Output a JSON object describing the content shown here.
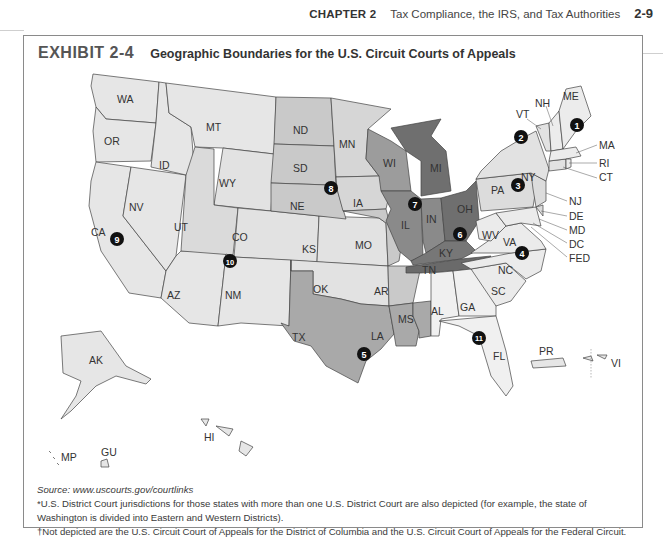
{
  "running_head": {
    "chapter": "CHAPTER 2",
    "title": "Tax Compliance, the IRS, and Tax Authorities",
    "page": "2-9"
  },
  "exhibit": {
    "number": "EXHIBIT 2-4",
    "title": "Geographic Boundaries for the U.S. Circuit Courts of Appeals"
  },
  "map": {
    "shade_colors": {
      "light": "#e6e6e6",
      "lighter": "#ececec",
      "medium": "#c9c9c9",
      "mediumdark": "#a9a9a9",
      "dark": "#7b7b7b",
      "darker": "#666666"
    },
    "states": [
      {
        "abbr": "WA",
        "circuit": 9,
        "districts": [
          "Western",
          "Eastern"
        ]
      },
      {
        "abbr": "OR",
        "circuit": 9
      },
      {
        "abbr": "CA",
        "circuit": 9,
        "districts": [
          "Northern",
          "Eastern",
          "Central",
          "Southern"
        ]
      },
      {
        "abbr": "NV",
        "circuit": 9
      },
      {
        "abbr": "ID",
        "circuit": 9
      },
      {
        "abbr": "MT",
        "circuit": 9
      },
      {
        "abbr": "AZ",
        "circuit": 9
      },
      {
        "abbr": "AK",
        "circuit": 9
      },
      {
        "abbr": "HI",
        "circuit": 9
      },
      {
        "abbr": "GU",
        "circuit": 9
      },
      {
        "abbr": "MP",
        "circuit": 9
      },
      {
        "abbr": "WY",
        "circuit": 10
      },
      {
        "abbr": "UT",
        "circuit": 10
      },
      {
        "abbr": "CO",
        "circuit": 10
      },
      {
        "abbr": "NM",
        "circuit": 10
      },
      {
        "abbr": "KS",
        "circuit": 10
      },
      {
        "abbr": "OK",
        "circuit": 10,
        "districts": [
          "Western",
          "Northern",
          "Eastern"
        ]
      },
      {
        "abbr": "ND",
        "circuit": 8
      },
      {
        "abbr": "SD",
        "circuit": 8
      },
      {
        "abbr": "NE",
        "circuit": 8
      },
      {
        "abbr": "MN",
        "circuit": 8
      },
      {
        "abbr": "IA",
        "circuit": 8,
        "districts": [
          "Northern",
          "Southern"
        ]
      },
      {
        "abbr": "MO",
        "circuit": 8,
        "districts": [
          "Western",
          "Eastern"
        ]
      },
      {
        "abbr": "AR",
        "circuit": 8,
        "districts": [
          "Western",
          "Eastern"
        ]
      },
      {
        "abbr": "TX",
        "circuit": 5,
        "districts": [
          "Northern",
          "Eastern",
          "Western",
          "Southern"
        ]
      },
      {
        "abbr": "LA",
        "circuit": 5,
        "districts": [
          "Western",
          "Middle",
          "Eastern"
        ]
      },
      {
        "abbr": "MS",
        "circuit": 5,
        "districts": [
          "Northern",
          "Southern"
        ]
      },
      {
        "abbr": "WI",
        "circuit": 7,
        "districts": [
          "Western",
          "Eastern"
        ]
      },
      {
        "abbr": "IL",
        "circuit": 7,
        "districts": [
          "Northern",
          "Central",
          "Southern"
        ]
      },
      {
        "abbr": "IN",
        "circuit": 7,
        "districts": [
          "Northern",
          "Southern"
        ]
      },
      {
        "abbr": "MI",
        "circuit": 6,
        "districts": [
          "Western",
          "Eastern"
        ]
      },
      {
        "abbr": "OH",
        "circuit": 6,
        "districts": [
          "Northern",
          "Southern"
        ]
      },
      {
        "abbr": "KY",
        "circuit": 6,
        "districts": [
          "Western",
          "Eastern"
        ]
      },
      {
        "abbr": "TN",
        "circuit": 6,
        "districts": [
          "Western",
          "Middle",
          "Eastern"
        ]
      },
      {
        "abbr": "AL",
        "circuit": 11,
        "districts": [
          "Northern",
          "Middle",
          "Southern"
        ]
      },
      {
        "abbr": "GA",
        "circuit": 11,
        "districts": [
          "Northern",
          "Middle",
          "Southern"
        ]
      },
      {
        "abbr": "FL",
        "circuit": 11,
        "districts": [
          "Northern",
          "Middle",
          "Southern"
        ]
      },
      {
        "abbr": "SC",
        "circuit": 4
      },
      {
        "abbr": "NC",
        "circuit": 4,
        "districts": [
          "Western",
          "Middle",
          "Eastern"
        ]
      },
      {
        "abbr": "VA",
        "circuit": 4,
        "districts": [
          "Western",
          "Eastern"
        ]
      },
      {
        "abbr": "WV",
        "circuit": 4,
        "districts": [
          "Northern",
          "Southern"
        ]
      },
      {
        "abbr": "MD",
        "circuit": 4
      },
      {
        "abbr": "PA",
        "circuit": 3,
        "districts": [
          "Western",
          "Middle",
          "Eastern"
        ]
      },
      {
        "abbr": "NJ",
        "circuit": 3
      },
      {
        "abbr": "DE",
        "circuit": 3
      },
      {
        "abbr": "VI",
        "circuit": 3
      },
      {
        "abbr": "NY",
        "circuit": 2,
        "districts": [
          "Northern",
          "Western",
          "Southern",
          "Eastern"
        ]
      },
      {
        "abbr": "VT",
        "circuit": 2
      },
      {
        "abbr": "CT",
        "circuit": 2
      },
      {
        "abbr": "ME",
        "circuit": 1
      },
      {
        "abbr": "NH",
        "circuit": 1
      },
      {
        "abbr": "MA",
        "circuit": 1
      },
      {
        "abbr": "RI",
        "circuit": 1
      },
      {
        "abbr": "PR",
        "circuit": 1
      }
    ],
    "callout_labels": [
      "NH",
      "VT",
      "ME",
      "MA",
      "RI",
      "CT",
      "NJ",
      "DE",
      "MD",
      "DC",
      "FED"
    ],
    "circuit_markers": [
      "1",
      "2",
      "3",
      "4",
      "5",
      "6",
      "7",
      "8",
      "9",
      "10",
      "11"
    ],
    "district_labels": {
      "western": "Western",
      "eastern": "Eastern",
      "northern": "Northern",
      "southern": "Southern",
      "central": "Central",
      "middle": "Middle"
    }
  },
  "notes": {
    "source": "Source: www.uscourts.gov/courtlinks",
    "note_a": "*U.S. District Court jurisdictions for those states with more than one U.S. District Court are also depicted (for example, the state of Washington is divided into Eastern and Western Districts).",
    "note_b": "†Not depicted are the U.S. Circuit Court of Appeals for the District of Columbia and the U.S. Circuit Court of Appeals for the Federal Circuit."
  }
}
